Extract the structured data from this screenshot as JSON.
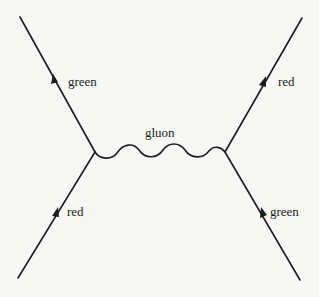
{
  "diagram": {
    "type": "feynman",
    "labels": {
      "top_left_quark": "green",
      "top_right_quark": "red",
      "gluon": "gluon",
      "bottom_left_quark": "red",
      "bottom_right_quark": "green"
    },
    "colors": {
      "line": "#1c1c1c",
      "background": "#f7f7f5"
    },
    "particles": [
      {
        "id": "incoming-left",
        "kind": "quark",
        "color_charge": "red",
        "from": "bottom-left",
        "to": "left-vertex"
      },
      {
        "id": "outgoing-left",
        "kind": "quark",
        "color_charge": "green",
        "from": "left-vertex",
        "to": "top-left"
      },
      {
        "id": "incoming-right",
        "kind": "quark",
        "color_charge": "green",
        "from": "bottom-right",
        "to": "right-vertex"
      },
      {
        "id": "outgoing-right",
        "kind": "quark",
        "color_charge": "red",
        "from": "right-vertex",
        "to": "top-right"
      },
      {
        "id": "exchange",
        "kind": "gluon",
        "from": "left-vertex",
        "to": "right-vertex"
      }
    ]
  }
}
